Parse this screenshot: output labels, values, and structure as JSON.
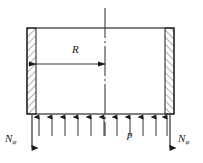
{
  "figure": {
    "kind": "engineering-diagram",
    "colors": {
      "background": "#ffffff",
      "line": "#1a1a1a",
      "hatch": "#3a3a3a",
      "centerline": "#2a2a2a",
      "text": "#1a1a1a"
    }
  },
  "labels": {
    "radius": {
      "symbol": "R",
      "subscript": "",
      "name": "radius-dimension"
    },
    "pressure": {
      "symbol": "p",
      "subscript": "",
      "name": "internal-pressure"
    },
    "force_left": {
      "symbol": "N",
      "subscript": "φ",
      "name": "meridional-force-left"
    },
    "force_right": {
      "symbol": "N",
      "subscript": "φ",
      "name": "meridional-force-right"
    }
  },
  "geometry": {
    "box": {
      "left": 27,
      "top": 28,
      "right": 174,
      "bottom": 114
    },
    "wall_thickness": 9,
    "centerline_x": 105,
    "centerline_top": 8,
    "centerline_bottom": 136,
    "dimension_line_y": 64,
    "dimension_from_x": 36,
    "dimension_to_x": 105,
    "pressure_arrow_count": 11,
    "pressure_arrow_tail_y": 136,
    "pressure_arrow_head_y": 116,
    "force_arrow_left_x": 32,
    "force_arrow_right_x": 170,
    "force_arrow_top_y": 115,
    "force_arrow_bottom_y": 148
  }
}
